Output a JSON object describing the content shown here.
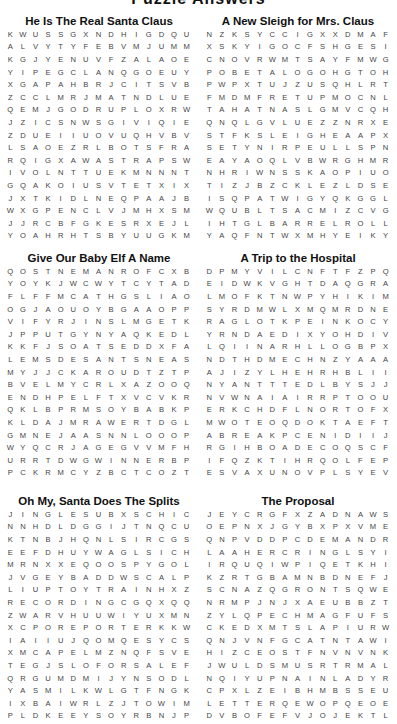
{
  "page_title": "Puzzle Answers",
  "puzzles": [
    {
      "title": "He Is The Real Santa Claus",
      "grid": [
        "KWUSSGXNDHIGDQU",
        "ALVYTYFEBVMJUMM",
        "KGJYENUVFZALAOE",
        "YIPEGCLANQGOEUY",
        "XGAPAHBRJCITSVB",
        "ZCCLMRJMATNDLUE",
        "QEMJGODRUPLOXRW",
        "JZICSNWSGIVIQIE",
        "ZDUEIIUOVUQHVBV",
        "LSAOEZRLBOTSFRA",
        "RQIGXAWASTRAPSW",
        "IVOLNTTUEKMNNNT",
        "GQAKOIUSVTETXIX",
        "JXTKIDLNEQPAAJB",
        "WXGPENCLVJMHXSM",
        "JJRCBFGKESRXEJL",
        "YOAHRHTSBYUUGKM"
      ]
    },
    {
      "title": "A New Sleigh for Mrs. Claus",
      "grid": [
        "NZKSYCCIGXXDMAF",
        "XSKYIGOCFSHGESI",
        "CNOVRWMTSAYFMWG",
        "POBETALOGOHGTOH",
        "PWPXTUJZUSQHLRT",
        "FMDMFRETUPMOCNL",
        "TAHATNASLGMVCQH",
        "QNQLGVLUEZZNRXE",
        "STFKSLEIGHEAAPX",
        "SETYNIRPEULLSPN",
        "EAYAOQLVBWRGHMR",
        "NHRIWNSSKAOPIUO",
        "TIZJBZCKLEZLDSE",
        "ISQPATWIGYQKGGL",
        "WQUBLTSACMIZCVG",
        "IHTGLBARRELROLL",
        "YAQFNTWXMHYEIKY"
      ]
    },
    {
      "title": "Give Our Baby Elf A Name",
      "grid": [
        "QOSTNEMANROFCXB",
        "YOYKJWCWYTCYTAD",
        "FLFFMCATHGSLIAO",
        "OGJAOUOYBGAAOPP",
        "VIFYRJINSLMGETK",
        "JPPUTGYNYAQKEDL",
        "KKFJSOATSEDDXFA",
        "LEMSDESANTSNEAS",
        "MYJJCKAROUDTZTP",
        "BVELMYCRLXAZOOQ",
        "ENDHPELFTXVCVKR",
        "QKLBPRMSOYBABKP",
        "KLDAJMRAWERTDGL",
        "GMNEJAASNNLOOOP",
        "WYQCRJAGEGVVMFH",
        "URRTDWGWINNERBP",
        "PCKRMCYZBCTCOZT"
      ]
    },
    {
      "title": "A Trip to the Hospital",
      "grid": [
        "DPMYVILCNFTFZPQ",
        "EIDWKVGHTDAQGRA",
        "LMOFKTNWPYHIKIM",
        "SYRDMWLXMQMRDNE",
        "RAGLOTKPEINKOCY",
        "YRNDAEDIXYOHDIV",
        "LQIINARHLLOGBPX",
        "NDTHDMECHNZYAAA",
        "AJIZYLHEHRHBLII",
        "NYANTTTEDLBYSJJ",
        "NVWNAIAIRRPTOOU",
        "ERKCHDFLNORTOFX",
        "MWOTEOQDOKTAEFT",
        "ABREAKPCENIDIIJ",
        "RGIHBOADECOQSCF",
        "IFQZKTIHRQOLFEP",
        "ESVAXUNOVPLSYEV"
      ]
    },
    {
      "title": "Oh My, Santa Does The Splits",
      "grid": [
        "JINGLESUBXSCHIC",
        "NNHDLDGGIJTNQCU",
        "KTNBJHQNLSIRCGS",
        "EEFDHUYWAGLSICH",
        "MRNXXEQOOSPYGOL",
        "JVGEYBADDWSCALP",
        "LIUPTOYTRAINHXZ",
        "RECORDINGCGQXQQ",
        "ZWARVHUUWIYUXMN",
        "XCPOREPORTERKKW",
        "IAIIUJQOMQESYCS",
        "XMCAPELMZNQFSVE",
        "TEGJSLOFORSALEF",
        "QRGUMDMIJYNSODL",
        "YASMILKWLGTFNGK",
        "IXBAIWRLZJTOWIM",
        "PLDKEEYSOYRBNJP"
      ]
    },
    {
      "title": "The Proposal",
      "grid": [
        "JEYCRGFXZADNAWS",
        "OEPNXJGYBXPXVME",
        "QNPVDDPCDEMANDR",
        "LAAHERCRINGLSYI",
        "IRQUQIWPIQETKHI",
        "KZRTGBAMNBDNEFJ",
        "SCNAZQGRONTSQWE",
        "NRMPJNJXAEUBBZT",
        "ZYLQPECHMAGFUFS",
        "CKEDXMTSLAPIURW",
        "QNJVNFGCATNTAWI",
        "HIZCEOSTFNVNVNK",
        "JWULDSMUSRTRMAL",
        "NQIYUPNAINLADYR",
        "CPXLZEIBHMBSSEU",
        "LETTERQEWOPQEOE",
        "DVBOFEFVJOJEKTL"
      ]
    }
  ]
}
